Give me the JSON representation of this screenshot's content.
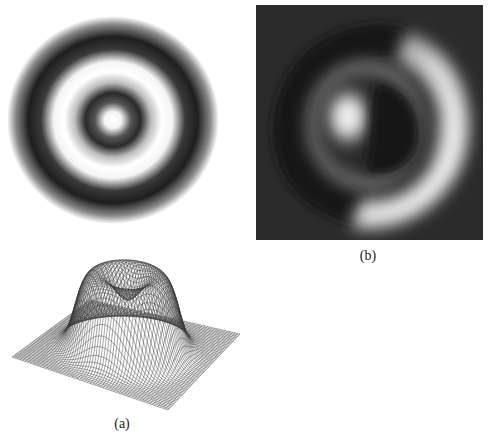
{
  "figure": {
    "panels": [
      {
        "id": "rings",
        "description": "Grayscale intensity image of concentric rings: white center, dark ring, white ring, dark outer ring on white background"
      },
      {
        "id": "phase",
        "label": "(b)",
        "description": "Dark-background grayscale image with bright crescent ring on right and a bright spot left of center"
      },
      {
        "id": "mesh",
        "label": "(a)",
        "description": "3D wireframe mesh surface plot of a plateau/dome with a central depression on a flat square plane"
      }
    ],
    "captions": {
      "a": "(a)",
      "b": "(b)"
    },
    "colors": {
      "background": "#ffffff",
      "ring_dark": "#1c1c1c",
      "phase_background": "#2a2a2a",
      "mesh_line": "#333333"
    }
  }
}
